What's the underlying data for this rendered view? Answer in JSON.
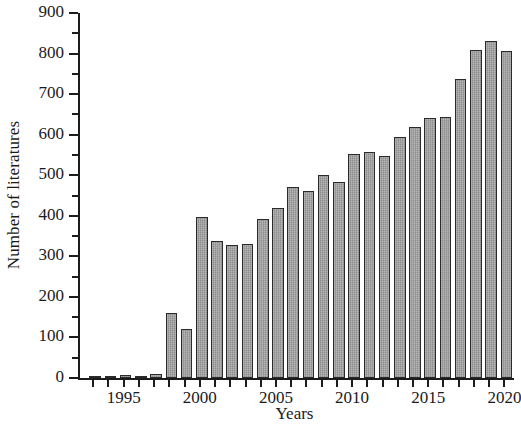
{
  "chart_data": {
    "type": "bar",
    "title": "",
    "subtitle": "",
    "xlabel": "Years",
    "ylabel": "Number of literatures",
    "categories": [
      1993,
      1994,
      1995,
      1996,
      1997,
      1998,
      1999,
      2000,
      2001,
      2002,
      2003,
      2004,
      2005,
      2006,
      2007,
      2008,
      2009,
      2010,
      2011,
      2012,
      2013,
      2014,
      2015,
      2016,
      2017,
      2018,
      2019,
      2020
    ],
    "values": [
      3,
      5,
      7,
      4,
      9,
      160,
      120,
      397,
      338,
      327,
      330,
      392,
      419,
      470,
      462,
      500,
      483,
      552,
      558,
      547,
      594,
      620,
      640,
      643,
      737,
      808,
      832,
      806
    ],
    "xtick_labels": [
      "1995",
      "2000",
      "2005",
      "2010",
      "2015",
      "2020"
    ],
    "xtick_values": [
      1995,
      2000,
      2005,
      2010,
      2015,
      2020
    ],
    "ytick_labels": [
      "0",
      "100",
      "200",
      "300",
      "400",
      "500",
      "600",
      "700",
      "800",
      "900"
    ],
    "ytick_values": [
      0,
      100,
      200,
      300,
      400,
      500,
      600,
      700,
      800,
      900
    ],
    "y_minor_ticks": [
      50,
      150,
      250,
      350,
      450,
      550,
      650,
      750,
      850
    ],
    "ylim": [
      0,
      900
    ],
    "xlim": [
      1992.5,
      2021.0
    ],
    "grid": false,
    "legend": false,
    "bar_color": "#9c9c9c",
    "bar_edge_color": "#2a2a2a",
    "axis_color": "#1c1c1c",
    "note_clipped_right": "2021"
  }
}
